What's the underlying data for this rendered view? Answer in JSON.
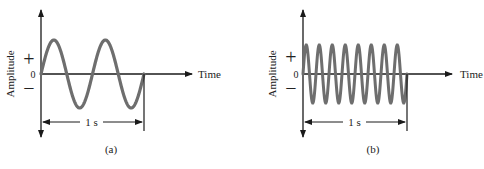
{
  "panels": [
    {
      "id": "a",
      "caption": "(a)",
      "y_axis_label": "Amplitude",
      "x_axis_label": "Time",
      "zero_label": "0",
      "plus_label": "+",
      "minus_label": "−",
      "duration_label": "1 s",
      "cycles_per_second": 2
    },
    {
      "id": "b",
      "caption": "(b)",
      "y_axis_label": "Amplitude",
      "x_axis_label": "Time",
      "zero_label": "0",
      "plus_label": "+",
      "minus_label": "−",
      "duration_label": "1 s",
      "cycles_per_second": 8
    }
  ],
  "colors": {
    "wave": "#6e6e6e",
    "axis": "#1a1a1a",
    "text": "#222222"
  }
}
